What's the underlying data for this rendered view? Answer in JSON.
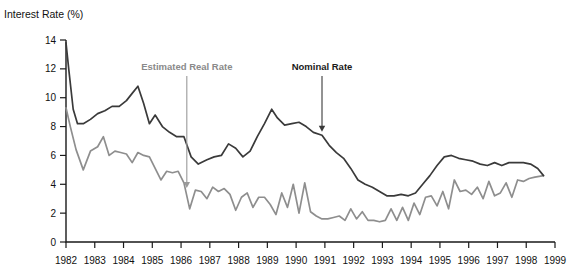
{
  "chart_data": {
    "type": "line",
    "title": "",
    "ylabel": "Interest Rate (%)",
    "xlabel": "",
    "ylim": [
      0,
      14
    ],
    "yticks": [
      0,
      2,
      4,
      6,
      8,
      10,
      12,
      14
    ],
    "ytick_labels": [
      "0",
      "2",
      "4",
      "6",
      "8",
      "10",
      "12",
      "14"
    ],
    "xlim": [
      1982,
      1999
    ],
    "xticks": [
      1982,
      1983,
      1984,
      1985,
      1986,
      1987,
      1988,
      1989,
      1990,
      1991,
      1992,
      1993,
      1994,
      1995,
      1996,
      1997,
      1998,
      1999
    ],
    "xtick_labels": [
      "1982",
      "1983",
      "1984",
      "1985",
      "1986",
      "1987",
      "1988",
      "1989",
      "1990",
      "1991",
      "1992",
      "1993",
      "1994",
      "1995",
      "1996",
      "1997",
      "1998",
      "1999"
    ],
    "grid": false,
    "legend": "annotations",
    "annotations": [
      {
        "text": "Estimated Real Rate",
        "x": 1986.2,
        "y": 3.6,
        "color": "#8a8a8a"
      },
      {
        "text": "Nominal Rate",
        "x": 1990.9,
        "y": 7.5,
        "color": "#1a1a1a"
      }
    ],
    "series": [
      {
        "name": "Nominal Rate",
        "color": "#3a3a3a",
        "x": [
          1982.0,
          1982.1,
          1982.25,
          1982.4,
          1982.6,
          1982.85,
          1983.1,
          1983.35,
          1983.6,
          1983.85,
          1984.1,
          1984.3,
          1984.5,
          1984.7,
          1984.9,
          1985.1,
          1985.35,
          1985.6,
          1985.85,
          1986.1,
          1986.35,
          1986.6,
          1986.9,
          1987.15,
          1987.4,
          1987.65,
          1987.9,
          1988.15,
          1988.4,
          1988.65,
          1988.9,
          1989.15,
          1989.35,
          1989.6,
          1989.85,
          1990.1,
          1990.35,
          1990.6,
          1990.9,
          1991.15,
          1991.4,
          1991.65,
          1991.9,
          1992.15,
          1992.4,
          1992.65,
          1992.9,
          1993.15,
          1993.4,
          1993.65,
          1993.9,
          1994.15,
          1994.4,
          1994.65,
          1994.9,
          1995.15,
          1995.4,
          1995.65,
          1995.9,
          1996.15,
          1996.4,
          1996.65,
          1996.9,
          1997.15,
          1997.4,
          1997.65,
          1997.9,
          1998.15,
          1998.4,
          1998.6
        ],
        "y": [
          13.8,
          11.9,
          9.2,
          8.2,
          8.2,
          8.5,
          8.9,
          9.1,
          9.4,
          9.4,
          9.8,
          10.3,
          10.8,
          9.6,
          8.2,
          8.8,
          8.0,
          7.6,
          7.3,
          7.3,
          5.9,
          5.4,
          5.7,
          5.9,
          6.0,
          6.8,
          6.5,
          5.9,
          6.3,
          7.3,
          8.2,
          9.2,
          8.6,
          8.1,
          8.2,
          8.3,
          8.0,
          7.6,
          7.4,
          6.7,
          6.2,
          5.8,
          5.1,
          4.3,
          4.0,
          3.8,
          3.5,
          3.2,
          3.2,
          3.3,
          3.2,
          3.4,
          4.0,
          4.6,
          5.3,
          5.9,
          6.0,
          5.8,
          5.7,
          5.6,
          5.4,
          5.3,
          5.5,
          5.3,
          5.5,
          5.5,
          5.5,
          5.4,
          5.1,
          4.6
        ]
      },
      {
        "name": "Estimated Real Rate",
        "color": "#8e8e8e",
        "x": [
          1982.0,
          1982.15,
          1982.35,
          1982.6,
          1982.85,
          1983.1,
          1983.3,
          1983.5,
          1983.7,
          1983.9,
          1984.1,
          1984.3,
          1984.5,
          1984.7,
          1984.9,
          1985.1,
          1985.3,
          1985.5,
          1985.7,
          1985.9,
          1986.1,
          1986.3,
          1986.5,
          1986.7,
          1986.9,
          1987.1,
          1987.3,
          1987.5,
          1987.7,
          1987.9,
          1988.1,
          1988.3,
          1988.5,
          1988.7,
          1988.9,
          1989.1,
          1989.3,
          1989.5,
          1989.7,
          1989.9,
          1990.1,
          1990.3,
          1990.5,
          1990.7,
          1990.9,
          1991.1,
          1991.3,
          1991.5,
          1991.7,
          1991.9,
          1992.1,
          1992.3,
          1992.5,
          1992.7,
          1992.9,
          1993.1,
          1993.3,
          1993.5,
          1993.7,
          1993.9,
          1994.1,
          1994.3,
          1994.5,
          1994.7,
          1994.9,
          1995.1,
          1995.3,
          1995.5,
          1995.7,
          1995.9,
          1996.1,
          1996.3,
          1996.5,
          1996.7,
          1996.9,
          1997.1,
          1997.3,
          1997.5,
          1997.7,
          1997.9,
          1998.1,
          1998.3,
          1998.6
        ],
        "y": [
          9.3,
          8.0,
          6.4,
          5.0,
          6.3,
          6.6,
          7.3,
          6.0,
          6.3,
          6.2,
          6.1,
          5.5,
          6.2,
          6.0,
          5.9,
          5.1,
          4.3,
          4.9,
          4.8,
          4.9,
          4.1,
          2.3,
          3.6,
          3.5,
          3.0,
          3.8,
          3.5,
          3.7,
          3.3,
          2.2,
          3.1,
          3.4,
          2.4,
          3.1,
          3.1,
          2.6,
          1.9,
          3.4,
          2.4,
          4.0,
          2.0,
          4.1,
          2.1,
          1.8,
          1.6,
          1.6,
          1.7,
          1.8,
          1.5,
          2.3,
          1.6,
          2.1,
          1.5,
          1.5,
          1.4,
          1.5,
          2.3,
          1.5,
          2.4,
          1.5,
          2.7,
          1.9,
          3.1,
          3.2,
          2.5,
          3.5,
          2.3,
          4.3,
          3.5,
          3.6,
          3.3,
          3.8,
          3.0,
          4.2,
          3.2,
          3.4,
          4.1,
          3.1,
          4.3,
          4.2,
          4.4,
          4.5,
          4.6
        ]
      }
    ]
  }
}
